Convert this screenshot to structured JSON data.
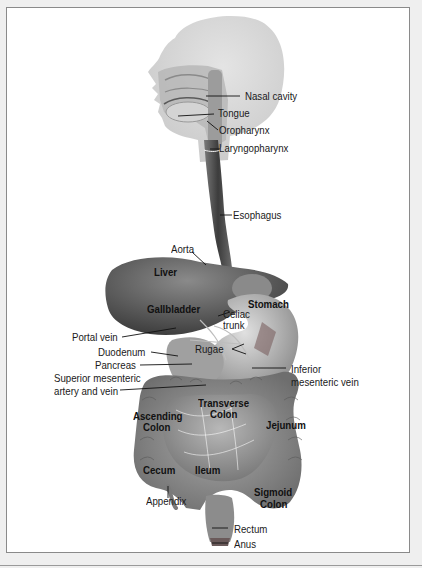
{
  "figure": {
    "labels": {
      "nasal_cavity": "Nasal cavity",
      "tongue": "Tongue",
      "oropharynx": "Oropharynx",
      "laryngopharynx": "Laryngopharynx",
      "esophagus": "Esophagus",
      "aorta": "Aorta",
      "liver": "Liver",
      "gallbladder": "Gallbladder",
      "stomach": "Stomach",
      "celiac_trunk_1": "Celiac",
      "celiac_trunk_2": "trunk",
      "portal_vein": "Portal vein",
      "rugae": "Rugae",
      "duodenum": "Duodenum",
      "pancreas": "Pancreas",
      "inferior_mesenteric_1": "Inferior",
      "inferior_mesenteric_2": "mesenteric vein",
      "superior_mesenteric_1": "Superior mesenteric",
      "superior_mesenteric_2": "artery and vein",
      "transverse_colon_1": "Transverse",
      "transverse_colon_2": "Colon",
      "ascending_colon_1": "Ascending",
      "ascending_colon_2": "Colon",
      "jejunum": "Jejunum",
      "cecum": "Cecum",
      "ileum": "Ileum",
      "appendix": "Appendix",
      "sigmoid_colon_1": "Sigmoid",
      "sigmoid_colon_2": "Colon",
      "rectum": "Rectum",
      "anus": "Anus"
    },
    "colors": {
      "frame_border": "#8a8a8a",
      "page_bg": "#efefef",
      "organ_dark": "#5a5a5a",
      "organ_mid": "#8c8c8c",
      "organ_light": "#c4c4c4",
      "head": "#d6d6d6"
    }
  }
}
